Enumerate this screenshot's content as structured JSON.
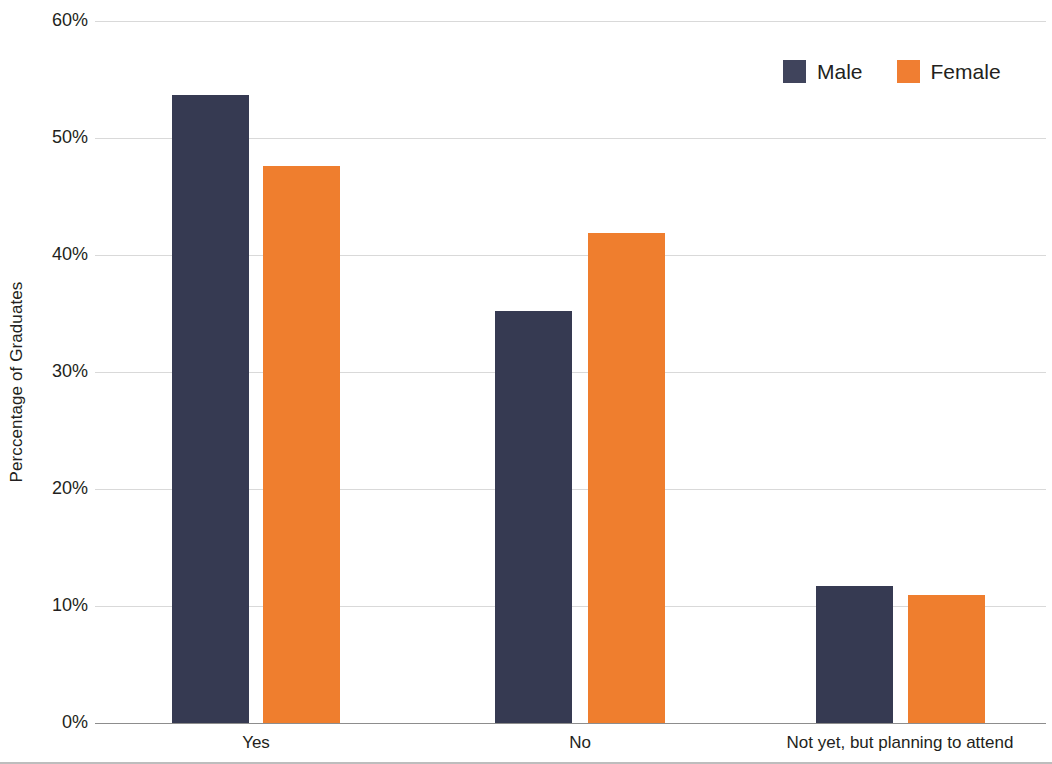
{
  "chart_data": {
    "type": "bar",
    "title": "",
    "subtitle": "",
    "xlabel": "",
    "ylabel": "Perccentage of Graduates",
    "categories": [
      "Yes",
      "No",
      "Not yet, but planning to attend"
    ],
    "series": [
      {
        "name": "Male",
        "color": "#363a52",
        "values": [
          53.7,
          35.2,
          11.7
        ]
      },
      {
        "name": "Female",
        "color": "#ef7e2e",
        "values": [
          47.6,
          41.9,
          10.9
        ]
      }
    ],
    "ylim": [
      0,
      60
    ],
    "ytick_values": [
      0,
      10,
      20,
      30,
      40,
      50,
      60
    ],
    "ytick_labels": [
      "0%",
      "10%",
      "20%",
      "30%",
      "40%",
      "50%",
      "60%"
    ],
    "grid": true,
    "grid_axis": "y",
    "legend_position": "top-right",
    "value_format": "percent"
  },
  "axis": {
    "y_title": "Perccentage of Graduates"
  },
  "legend": {
    "entries": [
      {
        "label": "Male",
        "color": "#363a52"
      },
      {
        "label": "Female",
        "color": "#ef7e2e"
      }
    ]
  },
  "colors": {
    "male": "#363a52",
    "female": "#ef7e2e",
    "gridline": "#d9d9d9",
    "axis": "#8d8d8d",
    "text": "#231f20",
    "background": "#ffffff"
  }
}
